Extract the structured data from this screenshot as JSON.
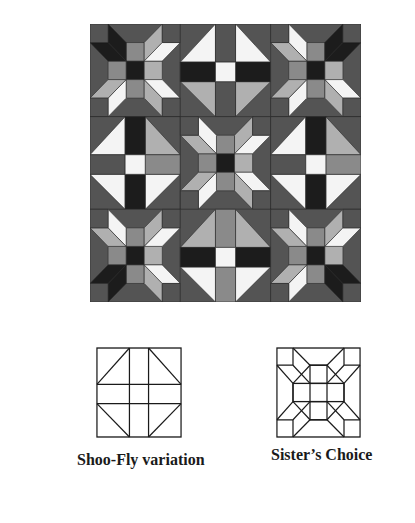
{
  "figure": {
    "quilt": {
      "layout": "3x3 blocks",
      "blocks": [
        {
          "row": 0,
          "col": 0,
          "pattern": "sisters-choice",
          "accent_corner": "top-left"
        },
        {
          "row": 0,
          "col": 1,
          "pattern": "shoo-fly-variation",
          "orientation": "points-up-white"
        },
        {
          "row": 0,
          "col": 2,
          "pattern": "sisters-choice",
          "accent_corner": "top-right"
        },
        {
          "row": 1,
          "col": 0,
          "pattern": "shoo-fly-variation",
          "orientation": "side"
        },
        {
          "row": 1,
          "col": 1,
          "pattern": "sisters-choice",
          "accent_corner": "none"
        },
        {
          "row": 1,
          "col": 2,
          "pattern": "shoo-fly-variation",
          "orientation": "side"
        },
        {
          "row": 2,
          "col": 0,
          "pattern": "sisters-choice",
          "accent_corner": "bottom-left"
        },
        {
          "row": 2,
          "col": 1,
          "pattern": "shoo-fly-variation",
          "orientation": "points-down-white"
        },
        {
          "row": 2,
          "col": 2,
          "pattern": "sisters-choice",
          "accent_corner": "bottom-right"
        }
      ],
      "colors": {
        "dark": "#545454",
        "black": "#1c1c1c",
        "mid": "#8a8a8a",
        "light": "#b0b0b0",
        "white": "#f4f4f4",
        "outline": "#2a2a2a"
      }
    },
    "diagrams": [
      {
        "id": "shoofly",
        "caption": "Shoo-Fly variation"
      },
      {
        "id": "sisters",
        "caption": "Sister’s Choice"
      }
    ]
  }
}
